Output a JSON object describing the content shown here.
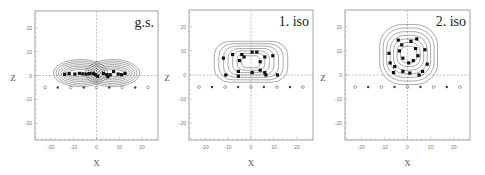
{
  "chart_data": [
    {
      "type": "scatter",
      "title": "g.s.",
      "xlabel": "X",
      "ylabel": "Z",
      "xlim": [
        -27,
        27
      ],
      "ylim": [
        -27,
        27
      ],
      "xticks": [
        -20,
        -10,
        0,
        10,
        20
      ],
      "yticks": [
        -20,
        -10,
        0,
        10,
        20
      ],
      "grid": false,
      "zero_lines": true,
      "frame": {
        "left": 35,
        "top": 11,
        "right": 158,
        "bottom": 140
      },
      "contours": {
        "cx": 0,
        "cz": 1,
        "rx": [
          6,
          8,
          10,
          12,
          14,
          16,
          18
        ],
        "rz": [
          1.5,
          2.2,
          2.9,
          3.6,
          4.3,
          5.0,
          5.7
        ],
        "lobes": [
          -7,
          7
        ]
      },
      "points": [
        [
          -14,
          0.5
        ],
        [
          -12,
          0.8
        ],
        [
          -9.5,
          0.6
        ],
        [
          -7.5,
          0.9
        ],
        [
          -6,
          0.7
        ],
        [
          -4.5,
          0.6
        ],
        [
          -3,
          0.8
        ],
        [
          -1.5,
          0.9
        ],
        [
          -0.5,
          0.3
        ],
        [
          0.5,
          -0.3
        ],
        [
          3,
          0.9
        ],
        [
          4.5,
          0.4
        ],
        [
          5,
          -0.5
        ],
        [
          6,
          0.3
        ],
        [
          7.5,
          1.6
        ],
        [
          9.5,
          0.6
        ],
        [
          11,
          0.3
        ],
        [
          12.5,
          0.9
        ]
      ],
      "reference_markers": {
        "z": -5,
        "x": [
          -22.6,
          -17,
          -11.3,
          -5.6,
          0,
          5.6,
          11.3,
          17,
          22.6
        ],
        "symbols": [
          "o",
          "*",
          "o",
          "*",
          "o",
          "*",
          "o",
          "*",
          "o"
        ]
      }
    },
    {
      "type": "scatter",
      "title": "1. iso",
      "xlabel": "X",
      "ylabel": "Z",
      "xlim": [
        -27,
        27
      ],
      "ylim": [
        -27,
        27
      ],
      "xticks": [
        -20,
        -10,
        0,
        10,
        20
      ],
      "yticks": [
        -20,
        -10,
        0,
        10,
        20
      ],
      "grid": false,
      "zero_lines": true,
      "frame": {
        "left": 189,
        "top": 10,
        "right": 313,
        "bottom": 140
      },
      "contours": {
        "cx": 0,
        "cz": 5.5,
        "rx": [
          4,
          6,
          8,
          10,
          12,
          14,
          16
        ],
        "rz": [
          2.5,
          3.5,
          4.5,
          5.5,
          6.5,
          7.5,
          8.5
        ],
        "lobes": []
      },
      "points": [
        [
          -12,
          7
        ],
        [
          -11,
          0
        ],
        [
          -8,
          8.5
        ],
        [
          -5.5,
          1.5
        ],
        [
          -5.5,
          -0.5
        ],
        [
          -5,
          6
        ],
        [
          -4,
          8.5
        ],
        [
          -3,
          7.5
        ],
        [
          0.5,
          9.5
        ],
        [
          0.5,
          1
        ],
        [
          2.5,
          9.5
        ],
        [
          4,
          2
        ],
        [
          4,
          5.5
        ],
        [
          6,
          1
        ],
        [
          6,
          7.5
        ],
        [
          6.5,
          0
        ],
        [
          9.5,
          8
        ],
        [
          11.5,
          0
        ]
      ],
      "reference_markers": {
        "z": -5,
        "x": [
          -22.6,
          -17,
          -11.3,
          -5.6,
          0,
          5.6,
          11.3,
          17,
          22.6
        ],
        "symbols": [
          "o",
          "*",
          "o",
          "*",
          "o",
          "*",
          "o",
          "*",
          "o"
        ]
      }
    },
    {
      "type": "scatter",
      "title": "2. iso",
      "xlabel": "X",
      "ylabel": "Z",
      "xlim": [
        -27,
        27
      ],
      "ylim": [
        -27,
        27
      ],
      "xticks": [
        -20,
        -10,
        0,
        10,
        20
      ],
      "yticks": [
        -20,
        -10,
        0,
        10,
        20
      ],
      "grid": false,
      "zero_lines": true,
      "frame": {
        "left": 345,
        "top": 10,
        "right": 470,
        "bottom": 140
      },
      "contours": {
        "cx": 0.5,
        "cz": 8.5,
        "rx": [
          3.5,
          5,
          6.5,
          8,
          9.5,
          11,
          12.5
        ],
        "rz": [
          3.5,
          5,
          6.5,
          8,
          9.5,
          11,
          12.5
        ],
        "lobes": []
      },
      "points": [
        [
          -4,
          14.5
        ],
        [
          -2.5,
          12.5
        ],
        [
          1.5,
          14
        ],
        [
          4,
          15
        ],
        [
          -8,
          9
        ],
        [
          -3.5,
          10
        ],
        [
          3.5,
          11
        ],
        [
          7.5,
          10.5
        ],
        [
          -2,
          7
        ],
        [
          0.5,
          5
        ],
        [
          2.5,
          6
        ],
        [
          4.5,
          8
        ],
        [
          -7.5,
          5
        ],
        [
          -5.5,
          3.5
        ],
        [
          8.5,
          4.5
        ],
        [
          -6,
          1
        ],
        [
          -2,
          1.5
        ],
        [
          1,
          0.8
        ],
        [
          5,
          0
        ],
        [
          6.5,
          1.5
        ]
      ],
      "reference_markers": {
        "z": -5,
        "x": [
          -22.6,
          -17,
          -11.3,
          -5.6,
          0,
          5.6,
          11.3,
          17,
          22.6
        ],
        "symbols": [
          "o",
          "*",
          "o",
          "*",
          "o",
          "*",
          "o",
          "*",
          "o"
        ]
      }
    }
  ]
}
